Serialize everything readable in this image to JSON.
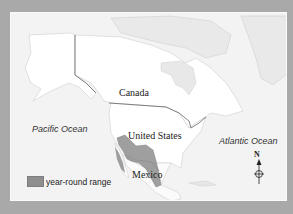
{
  "map": {
    "labels": {
      "canada": "Canada",
      "united_states": "United States",
      "mexico": "Mexico",
      "pacific": "Pacific Ocean",
      "atlantic": "Atlantic Ocean"
    },
    "legend": {
      "label": "year-round range",
      "color": "#8e8e8e"
    },
    "compass": {
      "label": "N"
    },
    "colors": {
      "border": "#a9a9a9",
      "ocean": "#f0f0f0",
      "highlight_land": "#ffffff",
      "other_land": "#e6e6e6",
      "range": "#8e8e8e"
    }
  }
}
